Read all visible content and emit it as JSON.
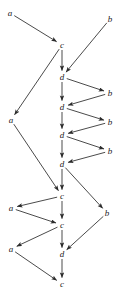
{
  "diagram": {
    "type": "directed-graph",
    "title": "",
    "background_color": "#ffffff",
    "node_color": "#1a1a1a",
    "edge_color": "#2b2b2b",
    "node_font_style": "italic-serif",
    "nodes": [
      {
        "id": "n1",
        "label": "a",
        "x": 10,
        "y": 13
      },
      {
        "id": "n2",
        "label": "b",
        "x": 110,
        "y": 19
      },
      {
        "id": "n3",
        "label": "c",
        "x": 62,
        "y": 45
      },
      {
        "id": "n4",
        "label": "d",
        "x": 62,
        "y": 77
      },
      {
        "id": "n5",
        "label": "b",
        "x": 110,
        "y": 93
      },
      {
        "id": "n6",
        "label": "d",
        "x": 62,
        "y": 107
      },
      {
        "id": "n7",
        "label": "b",
        "x": 110,
        "y": 122
      },
      {
        "id": "n8",
        "label": "d",
        "x": 62,
        "y": 135
      },
      {
        "id": "n9",
        "label": "b",
        "x": 110,
        "y": 151
      },
      {
        "id": "n10",
        "label": "d",
        "x": 62,
        "y": 164
      },
      {
        "id": "n11",
        "label": "a",
        "x": 11,
        "y": 120
      },
      {
        "id": "n12",
        "label": "c",
        "x": 62,
        "y": 196
      },
      {
        "id": "n13",
        "label": "a",
        "x": 11,
        "y": 208
      },
      {
        "id": "n14",
        "label": "b",
        "x": 107,
        "y": 213
      },
      {
        "id": "n15",
        "label": "c",
        "x": 62,
        "y": 225
      },
      {
        "id": "n16",
        "label": "a",
        "x": 11,
        "y": 249
      },
      {
        "id": "n17",
        "label": "d",
        "x": 62,
        "y": 254
      },
      {
        "id": "n18",
        "label": "c",
        "x": 62,
        "y": 284
      }
    ],
    "edges": [
      {
        "from": "n1",
        "to": "n3"
      },
      {
        "from": "n2",
        "to": "n4"
      },
      {
        "from": "n3",
        "to": "n4"
      },
      {
        "from": "n3",
        "to": "n11"
      },
      {
        "from": "n4",
        "to": "n5"
      },
      {
        "from": "n4",
        "to": "n6"
      },
      {
        "from": "n5",
        "to": "n6"
      },
      {
        "from": "n6",
        "to": "n7"
      },
      {
        "from": "n6",
        "to": "n8"
      },
      {
        "from": "n7",
        "to": "n8"
      },
      {
        "from": "n8",
        "to": "n9"
      },
      {
        "from": "n8",
        "to": "n10"
      },
      {
        "from": "n9",
        "to": "n10"
      },
      {
        "from": "n10",
        "to": "n12"
      },
      {
        "from": "n10",
        "to": "n14"
      },
      {
        "from": "n11",
        "to": "n12"
      },
      {
        "from": "n12",
        "to": "n13"
      },
      {
        "from": "n12",
        "to": "n15"
      },
      {
        "from": "n13",
        "to": "n15"
      },
      {
        "from": "n14",
        "to": "n17"
      },
      {
        "from": "n15",
        "to": "n16"
      },
      {
        "from": "n15",
        "to": "n17"
      },
      {
        "from": "n16",
        "to": "n18"
      },
      {
        "from": "n17",
        "to": "n18"
      }
    ]
  }
}
